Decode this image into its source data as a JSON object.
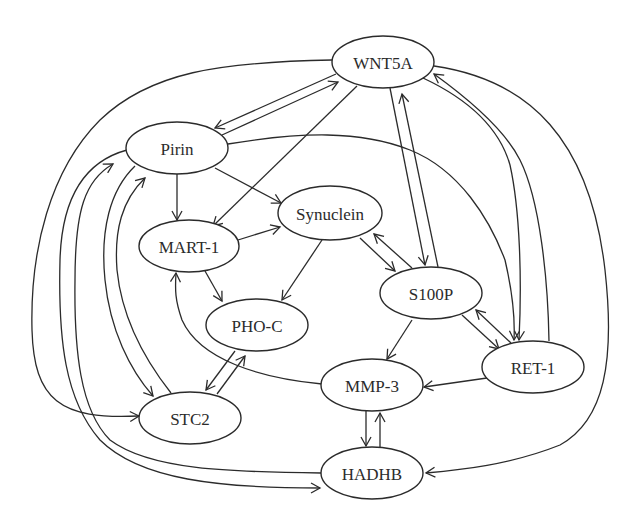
{
  "diagram": {
    "type": "gene-interaction-network",
    "nodes": [
      {
        "id": "WNT5A",
        "label": "WNT5A",
        "cx": 383,
        "cy": 62,
        "rx": 51,
        "ry": 26
      },
      {
        "id": "Pirin",
        "label": "Pirin",
        "cx": 177,
        "cy": 148,
        "rx": 51,
        "ry": 26
      },
      {
        "id": "Synuclein",
        "label": "Synuclein",
        "cx": 330,
        "cy": 213,
        "rx": 52,
        "ry": 27
      },
      {
        "id": "MART-1",
        "label": "MART-1",
        "cx": 189,
        "cy": 246,
        "rx": 50,
        "ry": 26
      },
      {
        "id": "S100P",
        "label": "S100P",
        "cx": 431,
        "cy": 293,
        "rx": 51,
        "ry": 26
      },
      {
        "id": "PHO-C",
        "label": "PHO-C",
        "cx": 257,
        "cy": 325,
        "rx": 51,
        "ry": 26
      },
      {
        "id": "RET-1",
        "label": "RET-1",
        "cx": 533,
        "cy": 367,
        "rx": 51,
        "ry": 26
      },
      {
        "id": "MMP-3",
        "label": "MMP-3",
        "cx": 372,
        "cy": 385,
        "rx": 51,
        "ry": 26
      },
      {
        "id": "STC2",
        "label": "STC2",
        "cx": 190,
        "cy": 418,
        "rx": 51,
        "ry": 26
      },
      {
        "id": "HADHB",
        "label": "HADHB",
        "cx": 372,
        "cy": 473,
        "rx": 51,
        "ry": 26
      }
    ],
    "edges": [
      {
        "from": "WNT5A",
        "to": "Pirin"
      },
      {
        "from": "Pirin",
        "to": "WNT5A"
      },
      {
        "from": "WNT5A",
        "to": "MART-1"
      },
      {
        "from": "WNT5A",
        "to": "S100P"
      },
      {
        "from": "S100P",
        "to": "WNT5A"
      },
      {
        "from": "WNT5A",
        "to": "RET-1"
      },
      {
        "from": "RET-1",
        "to": "WNT5A"
      },
      {
        "from": "WNT5A",
        "to": "HADHB"
      },
      {
        "from": "WNT5A",
        "to": "STC2"
      },
      {
        "from": "Pirin",
        "to": "MART-1"
      },
      {
        "from": "Pirin",
        "to": "Synuclein"
      },
      {
        "from": "Pirin",
        "to": "RET-1"
      },
      {
        "from": "Pirin",
        "to": "STC2"
      },
      {
        "from": "STC2",
        "to": "Pirin"
      },
      {
        "from": "Pirin",
        "to": "HADHB"
      },
      {
        "from": "HADHB",
        "to": "Pirin"
      },
      {
        "from": "MART-1",
        "to": "Synuclein"
      },
      {
        "from": "MART-1",
        "to": "PHO-C"
      },
      {
        "from": "Synuclein",
        "to": "PHO-C"
      },
      {
        "from": "Synuclein",
        "to": "S100P"
      },
      {
        "from": "S100P",
        "to": "Synuclein"
      },
      {
        "from": "S100P",
        "to": "MMP-3"
      },
      {
        "from": "S100P",
        "to": "RET-1"
      },
      {
        "from": "RET-1",
        "to": "S100P"
      },
      {
        "from": "RET-1",
        "to": "MMP-3"
      },
      {
        "from": "MMP-3",
        "to": "MART-1"
      },
      {
        "from": "MMP-3",
        "to": "HADHB"
      },
      {
        "from": "HADHB",
        "to": "MMP-3"
      },
      {
        "from": "PHO-C",
        "to": "STC2"
      },
      {
        "from": "STC2",
        "to": "PHO-C"
      }
    ],
    "colors": {
      "stroke": "#2b2b2b",
      "node_fill": "#ffffff",
      "background": "#ffffff"
    }
  }
}
